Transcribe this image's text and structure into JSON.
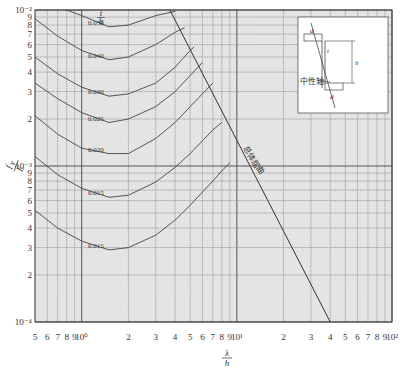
{
  "chart_data": {
    "type": "line",
    "title": "",
    "xlabel": "λ/h",
    "ylabel": "f_y/E",
    "xscale": "log",
    "yscale": "log",
    "xlim": [
      0.5,
      100
    ],
    "ylim": [
      0.0001,
      0.01
    ],
    "grid": true,
    "x_tick_labels": [
      "5",
      "6",
      "7",
      "8",
      "9",
      "10⁰",
      "2",
      "3",
      "4",
      "5",
      "6",
      "7",
      "8",
      "9",
      "10¹",
      "2",
      "3",
      "4",
      "5",
      "6",
      "7",
      "8",
      "9",
      "10²"
    ],
    "y_tick_labels": [
      "10⁻²",
      "9",
      "8",
      "7",
      "6",
      "5",
      "4",
      "3",
      "2",
      "10⁻³",
      "9",
      "8",
      "7",
      "6",
      "5",
      "4",
      "3",
      "2",
      "10⁻⁴"
    ],
    "curve_parameter_label": "t/h",
    "series": [
      {
        "name": "0.050",
        "x": [
          0.8,
          1.0,
          1.5,
          2.0,
          3.0,
          4.0
        ],
        "y": [
          0.0115,
          0.0092,
          0.0078,
          0.008,
          0.0092,
          0.0098
        ]
      },
      {
        "name": "0.040",
        "x": [
          0.5,
          0.7,
          1.0,
          1.5,
          2.0,
          3.0,
          4.0,
          4.6
        ],
        "y": [
          0.0088,
          0.0068,
          0.0055,
          0.0048,
          0.005,
          0.006,
          0.0072,
          0.0077
        ]
      },
      {
        "name": "0.030",
        "x": [
          0.5,
          0.7,
          1.0,
          1.5,
          2.0,
          3.0,
          4.0,
          5.0,
          5.3
        ],
        "y": [
          0.005,
          0.0039,
          0.0032,
          0.0028,
          0.0029,
          0.0034,
          0.0043,
          0.0055,
          0.0058
        ]
      },
      {
        "name": "0.025",
        "x": [
          0.5,
          0.7,
          1.0,
          1.5,
          2.0,
          3.0,
          4.0,
          5.0,
          6.0
        ],
        "y": [
          0.0034,
          0.0027,
          0.0022,
          0.0019,
          0.002,
          0.0024,
          0.003,
          0.0038,
          0.0046
        ]
      },
      {
        "name": "0.020",
        "x": [
          0.5,
          0.7,
          1.0,
          1.5,
          2.0,
          3.0,
          4.0,
          5.0,
          6.0,
          7.0
        ],
        "y": [
          0.0021,
          0.0016,
          0.0013,
          0.0012,
          0.0012,
          0.0015,
          0.0019,
          0.0024,
          0.0029,
          0.0034
        ]
      },
      {
        "name": "0.015",
        "x": [
          0.5,
          0.7,
          1.0,
          1.5,
          2.0,
          3.0,
          4.0,
          5.0,
          6.0,
          7.0,
          8.0
        ],
        "y": [
          0.00115,
          0.00088,
          0.00072,
          0.00063,
          0.00065,
          0.00079,
          0.00098,
          0.0012,
          0.00145,
          0.0017,
          0.0019
        ]
      },
      {
        "name": "0.015",
        "x": [
          0.5,
          0.7,
          1.0,
          1.5,
          2.0,
          3.0,
          4.0,
          5.0,
          6.0,
          7.0,
          8.0,
          9.0
        ],
        "y": [
          0.00052,
          0.0004,
          0.00033,
          0.00029,
          0.0003,
          0.00036,
          0.00045,
          0.00056,
          0.00068,
          0.0008,
          0.00093,
          0.00105
        ]
      }
    ],
    "envelope": {
      "name": "总体屈曲",
      "x": [
        3.7,
        40
      ],
      "y": [
        0.01,
        0.0001
      ]
    },
    "annotations": [
      {
        "text": "t/h",
        "position": "top of curve labels"
      },
      {
        "text": "总体屈曲",
        "position": "along diagonal envelope line"
      }
    ],
    "inset": {
      "labels": [
        "d",
        "t",
        "h",
        "中性轴",
        "d"
      ],
      "description": "Cross-section diagram of corrugated/channel section with neutral axis"
    }
  },
  "colors": {
    "plot_bg": "#e4e4e4",
    "grid_major": "#555555",
    "grid_minor": "#8a8a8a",
    "curve": "#444444",
    "text": "#333333"
  }
}
